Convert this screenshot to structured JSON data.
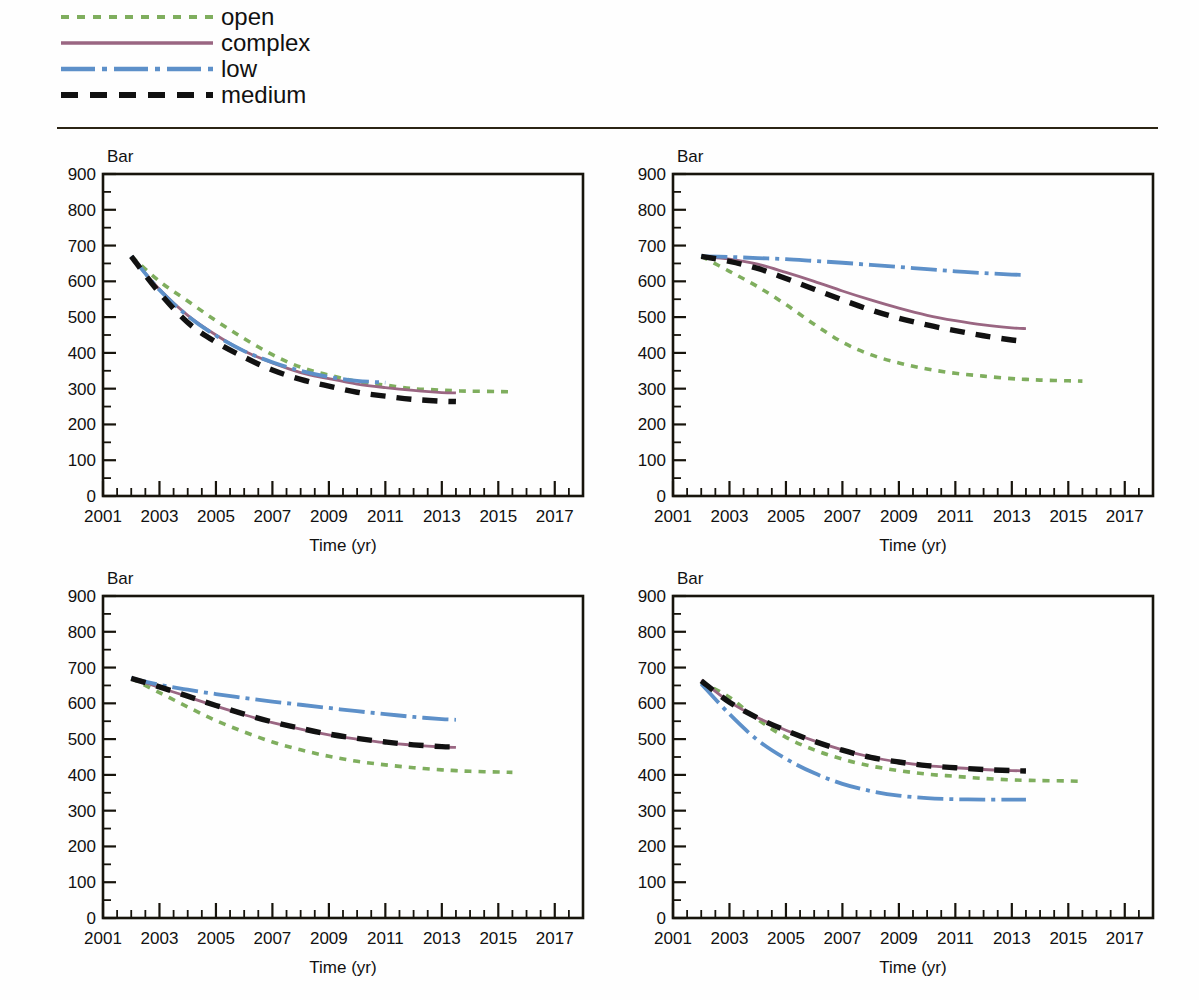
{
  "legend": {
    "position": "top-left",
    "items": [
      {
        "label": "open",
        "color": "#7fae5e",
        "style": "dotted"
      },
      {
        "label": "complex",
        "color": "#9a6682",
        "style": "solid"
      },
      {
        "label": "low",
        "color": "#5d90c9",
        "style": "dashdot"
      },
      {
        "label": "medium",
        "color": "#111111",
        "style": "dashed"
      }
    ]
  },
  "axes": {
    "ylabel": "Bar",
    "xlabel": "Time (yr)",
    "ylim": [
      0,
      900
    ],
    "ytick_labels": [
      "900",
      "800",
      "700",
      "600",
      "500",
      "400",
      "300",
      "200",
      "100",
      "0"
    ],
    "ytick_values": [
      900,
      800,
      700,
      600,
      500,
      400,
      300,
      200,
      100,
      0
    ],
    "yminor_step": 50,
    "xlim": [
      2001,
      2018
    ],
    "xtick_labels": [
      "2001",
      "2003",
      "2005",
      "2007",
      "2009",
      "2011",
      "2013",
      "2015",
      "2017"
    ],
    "xtick_values": [
      2001,
      2003,
      2005,
      2007,
      2009,
      2011,
      2013,
      2015,
      2017
    ],
    "xminor_step": 0.5,
    "grid": false
  },
  "chart_data": [
    {
      "type": "line",
      "panel": "top-left",
      "title": "",
      "xlabel": "Time (yr)",
      "ylabel": "Bar",
      "xlim": [
        2001,
        2018
      ],
      "ylim": [
        0,
        900
      ],
      "grid": false,
      "legend_position": "top-left (shared)",
      "x": [
        2002,
        2003,
        2004,
        2005,
        2006,
        2007,
        2008,
        2009,
        2010,
        2011,
        2012,
        2013,
        2013.5,
        2014,
        2015,
        2015.5
      ],
      "series": [
        {
          "name": "open",
          "color": "#7fae5e",
          "style": "dotted",
          "values": [
            670,
            600,
            545,
            490,
            440,
            395,
            360,
            338,
            320,
            310,
            300,
            296,
            294,
            293,
            292,
            291
          ]
        },
        {
          "name": "complex",
          "color": "#9a6682",
          "style": "solid",
          "values": [
            670,
            578,
            505,
            450,
            405,
            372,
            345,
            328,
            313,
            303,
            295,
            289,
            288,
            null,
            null,
            null
          ]
        },
        {
          "name": "low",
          "color": "#5d90c9",
          "style": "dashdot",
          "values": [
            670,
            576,
            503,
            448,
            405,
            374,
            350,
            333,
            322,
            317,
            null,
            null,
            null,
            null,
            null,
            null
          ]
        },
        {
          "name": "medium",
          "color": "#111111",
          "style": "dashed",
          "values": [
            670,
            568,
            485,
            430,
            388,
            352,
            326,
            307,
            290,
            279,
            270,
            265,
            264,
            null,
            null,
            null
          ]
        }
      ]
    },
    {
      "type": "line",
      "panel": "top-right",
      "title": "",
      "xlabel": "Time (yr)",
      "ylabel": "Bar",
      "xlim": [
        2001,
        2018
      ],
      "ylim": [
        0,
        900
      ],
      "grid": false,
      "legend_position": "top-left (shared)",
      "x": [
        2002,
        2003,
        2004,
        2005,
        2006,
        2007,
        2008,
        2009,
        2010,
        2011,
        2012,
        2013,
        2013.5,
        2014,
        2015,
        2015.5
      ],
      "series": [
        {
          "name": "open",
          "color": "#7fae5e",
          "style": "dotted",
          "values": [
            670,
            628,
            585,
            535,
            480,
            430,
            395,
            372,
            355,
            343,
            335,
            328,
            326,
            324,
            322,
            321
          ]
        },
        {
          "name": "complex",
          "color": "#9a6682",
          "style": "solid",
          "values": [
            670,
            662,
            648,
            625,
            600,
            573,
            548,
            525,
            505,
            490,
            478,
            470,
            468,
            null,
            null,
            null
          ]
        },
        {
          "name": "low",
          "color": "#5d90c9",
          "style": "dashdot",
          "values": [
            670,
            668,
            665,
            662,
            657,
            652,
            646,
            640,
            634,
            628,
            623,
            619,
            618,
            null,
            null,
            null
          ]
        },
        {
          "name": "medium",
          "color": "#111111",
          "style": "dashed",
          "values": [
            670,
            656,
            636,
            608,
            578,
            548,
            520,
            497,
            478,
            462,
            448,
            436,
            432,
            null,
            null,
            null
          ]
        }
      ]
    },
    {
      "type": "line",
      "panel": "bottom-left",
      "title": "",
      "xlabel": "Time (yr)",
      "ylabel": "Bar",
      "xlim": [
        2001,
        2018
      ],
      "ylim": [
        0,
        900
      ],
      "grid": false,
      "legend_position": "top-left (shared)",
      "x": [
        2002,
        2003,
        2004,
        2005,
        2006,
        2007,
        2008,
        2009,
        2010,
        2011,
        2012,
        2013,
        2013.5,
        2014,
        2015,
        2015.5
      ],
      "series": [
        {
          "name": "open",
          "color": "#7fae5e",
          "style": "dotted",
          "values": [
            670,
            630,
            590,
            552,
            520,
            492,
            470,
            452,
            438,
            428,
            420,
            414,
            412,
            410,
            408,
            407
          ]
        },
        {
          "name": "complex",
          "color": "#9a6682",
          "style": "solid",
          "values": [
            670,
            645,
            618,
            592,
            568,
            546,
            528,
            512,
            500,
            490,
            483,
            478,
            477,
            null,
            null,
            null
          ]
        },
        {
          "name": "low",
          "color": "#5d90c9",
          "style": "dashdot",
          "values": [
            670,
            652,
            638,
            626,
            615,
            605,
            596,
            587,
            578,
            570,
            562,
            556,
            554,
            null,
            null,
            null
          ]
        },
        {
          "name": "medium",
          "color": "#111111",
          "style": "dashed",
          "values": [
            670,
            646,
            620,
            594,
            570,
            548,
            530,
            514,
            502,
            492,
            484,
            479,
            478,
            null,
            null,
            null
          ]
        }
      ]
    },
    {
      "type": "line",
      "panel": "bottom-right",
      "title": "",
      "xlabel": "Time (yr)",
      "ylabel": "Bar",
      "xlim": [
        2001,
        2018
      ],
      "ylim": [
        0,
        900
      ],
      "grid": false,
      "legend_position": "top-left (shared)",
      "x": [
        2002,
        2003,
        2004,
        2005,
        2006,
        2007,
        2008,
        2009,
        2010,
        2011,
        2012,
        2013,
        2013.5,
        2014,
        2015,
        2015.5
      ],
      "series": [
        {
          "name": "open",
          "color": "#7fae5e",
          "style": "dotted",
          "values": [
            660,
            617,
            555,
            505,
            470,
            444,
            425,
            412,
            402,
            396,
            390,
            386,
            385,
            384,
            383,
            382
          ]
        },
        {
          "name": "complex",
          "color": "#9a6682",
          "style": "solid",
          "values": [
            665,
            604,
            560,
            525,
            495,
            470,
            450,
            436,
            426,
            420,
            415,
            412,
            411,
            null,
            null,
            null
          ]
        },
        {
          "name": "low",
          "color": "#5d90c9",
          "style": "dashdot",
          "values": [
            655,
            570,
            497,
            445,
            405,
            375,
            355,
            342,
            335,
            332,
            331,
            331,
            331,
            null,
            null,
            null
          ]
        },
        {
          "name": "medium",
          "color": "#111111",
          "style": "dashed",
          "values": [
            663,
            603,
            559,
            524,
            494,
            469,
            449,
            436,
            426,
            420,
            415,
            412,
            411,
            null,
            null,
            null
          ]
        }
      ]
    }
  ]
}
